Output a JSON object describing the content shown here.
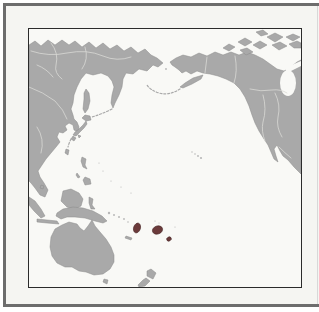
{
  "colors": {
    "page": "#ffffff",
    "frame": "#6d6d6d",
    "panel": "#f5f5f2",
    "map_border": "#2b2b2b",
    "ocean": "#f9f9f6",
    "land": "#a9a9a9",
    "coast": "#8a8a8a",
    "interior_lines": "#d9d9d5",
    "islet": "#b8b8b8",
    "highlight": "#6b3a3a",
    "highlight_edge": "#472525",
    "edge_line": "#d8d8d8"
  },
  "map": {
    "type": "geographic",
    "area": "pacific-ocean-centered-world-map",
    "landmasses": [
      "siberia-russia",
      "east-asia",
      "korea",
      "japan",
      "taiwan",
      "philippines",
      "borneo",
      "indonesia",
      "new-guinea",
      "australia",
      "tasmania",
      "new-zealand",
      "alaska",
      "canada",
      "united-states",
      "mexico",
      "canadian-arctic-islands"
    ],
    "highlighted_islands": [
      "vanuatu",
      "fiji",
      "tonga"
    ],
    "small_features": [
      "hawaii",
      "aleutian-islands",
      "kuril-islands",
      "sakhalin",
      "solomon-islands",
      "new-caledonia",
      "hudson-bay",
      "sea-of-okhotsk"
    ]
  }
}
